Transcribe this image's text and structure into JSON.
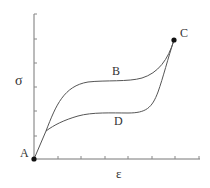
{
  "diagram": {
    "type": "stress-strain hysteresis",
    "axes": {
      "y_label": "σ",
      "x_label": "ε",
      "y_ticks_count": 6,
      "x_ticks_count": 7
    },
    "points": {
      "A": "A",
      "B": "B",
      "C": "C",
      "D": "D"
    },
    "curves": [
      {
        "name": "loading",
        "path": "A-B-C"
      },
      {
        "name": "unloading",
        "path": "C-D-A"
      }
    ],
    "colors": {
      "line": "#555555",
      "axis": "#777777",
      "point": "#111111",
      "text": "#333333"
    }
  }
}
